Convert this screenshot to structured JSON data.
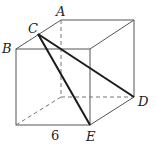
{
  "diagram": {
    "type": "cube",
    "labels": {
      "A": "A",
      "B": "B",
      "C": "C",
      "D": "D",
      "E": "E"
    },
    "edge_length_label": "6",
    "colors": {
      "edge": "#555555",
      "hidden_edge": "#777777",
      "triangle": "#1a1a1a",
      "text": "#222222"
    }
  }
}
